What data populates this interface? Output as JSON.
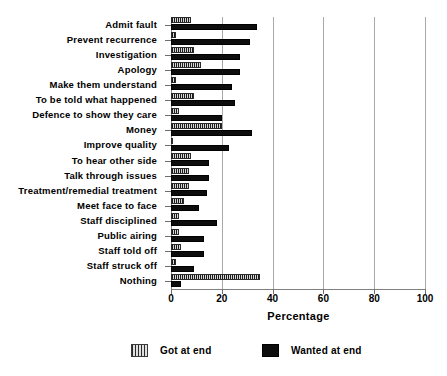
{
  "chart_data": {
    "type": "bar",
    "orientation": "horizontal",
    "title": "",
    "xlabel": "Percentage",
    "ylabel": "",
    "xlim": [
      0,
      100
    ],
    "xticks": [
      0,
      20,
      40,
      60,
      80,
      100
    ],
    "grid": "vertical gridlines at each x tick",
    "legend_position": "bottom",
    "categories": [
      "Admit fault",
      "Prevent recurrence",
      "Investigation",
      "Apology",
      "Make them understand",
      "To be told what happened",
      "Defence to show they care",
      "Money",
      "Improve quality",
      "To hear other side",
      "Talk through issues",
      "Treatment/remedial treatment",
      "Meet face to face",
      "Staff disciplined",
      "Public airing",
      "Staff told off",
      "Staff struck off",
      "Nothing"
    ],
    "series": [
      {
        "name": "Got at end",
        "values": [
          8,
          2,
          9,
          12,
          2,
          9,
          3,
          20,
          0.5,
          8,
          7,
          7,
          5,
          3,
          3,
          4,
          2,
          35
        ]
      },
      {
        "name": "Wanted at end",
        "values": [
          34,
          31,
          27,
          27,
          24,
          25,
          20,
          32,
          23,
          15,
          15,
          14,
          11,
          18,
          13,
          13,
          9,
          4
        ]
      }
    ]
  },
  "axis": {
    "x_title": "Percentage",
    "tick_labels": [
      "0",
      "20",
      "40",
      "60",
      "80",
      "100"
    ]
  },
  "legend": {
    "entries": [
      {
        "label": "Got at end",
        "swatch": "hatched-vertical-lines"
      },
      {
        "label": "Wanted at end",
        "swatch": "solid-black"
      }
    ]
  },
  "colors": {
    "got_at_end": "#8e8e8e",
    "wanted_at_end": "#0d0d0d",
    "gridline": "#a9a9a9",
    "axis": "#6e6e6e",
    "background": "#ffffff"
  }
}
